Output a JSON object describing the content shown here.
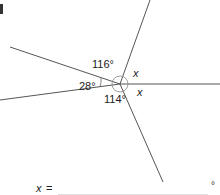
{
  "diagram": {
    "type": "angles-around-a-point",
    "center": [
      120,
      84
    ],
    "line_color": "#555555",
    "rays": [
      {
        "name": "top",
        "end": [
          150,
          0
        ]
      },
      {
        "name": "upper-left",
        "end": [
          10,
          47
        ]
      },
      {
        "name": "lower-left",
        "end": [
          0,
          100
        ]
      },
      {
        "name": "right",
        "end": [
          220,
          84
        ]
      },
      {
        "name": "lower-right",
        "end": [
          163,
          182
        ]
      }
    ],
    "angles": [
      {
        "label": "116°",
        "between": [
          "upper-left",
          "top"
        ]
      },
      {
        "label": "28°",
        "between": [
          "upper-left",
          "lower-left"
        ]
      },
      {
        "label": "114°",
        "between": [
          "lower-left",
          "lower-right"
        ]
      },
      {
        "label": "x",
        "between": [
          "top",
          "right"
        ]
      },
      {
        "label": "x",
        "between": [
          "right",
          "lower-right"
        ]
      }
    ]
  },
  "labels": {
    "a116": "116°",
    "a28": "28°",
    "a114": "114°",
    "x1": "x",
    "x2": "x"
  },
  "answer": {
    "variable": "x",
    "equals": "=",
    "value": "",
    "unit": "°"
  }
}
